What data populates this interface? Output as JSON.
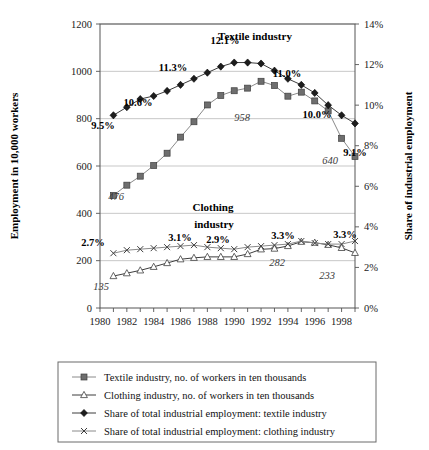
{
  "chart_data": {
    "type": "line",
    "title": "",
    "xlabel": "",
    "ylabel": "Employment in 10,000 workers",
    "y2label": "Share of industrial employment",
    "xlim": [
      1980,
      1999
    ],
    "ylim": [
      0,
      1200
    ],
    "y2lim": [
      0,
      14
    ],
    "grid": true,
    "legend_position": "bottom",
    "x": [
      1981,
      1982,
      1983,
      1984,
      1985,
      1986,
      1987,
      1988,
      1989,
      1990,
      1991,
      1992,
      1993,
      1994,
      1995,
      1996,
      1997,
      1998,
      1999
    ],
    "xtick_labels": [
      "1980",
      "1982",
      "1984",
      "1986",
      "1988",
      "1990",
      "1992",
      "1994",
      "1996",
      "1998"
    ],
    "xticks": [
      1980,
      1982,
      1984,
      1986,
      1988,
      1990,
      1992,
      1994,
      1996,
      1998
    ],
    "ytick_labels": [
      "0",
      "200",
      "400",
      "600",
      "800",
      "1000",
      "1200"
    ],
    "yticks": [
      0,
      200,
      400,
      600,
      800,
      1000,
      1200
    ],
    "y2tick_labels": [
      "0%",
      "2%",
      "4%",
      "6%",
      "8%",
      "10%",
      "12%",
      "14%"
    ],
    "y2ticks": [
      0,
      2,
      4,
      6,
      8,
      10,
      12,
      14
    ],
    "series": [
      {
        "name": "Textile industry, no. of workers in ten thousands",
        "key": "textile_workers",
        "axis": "left",
        "marker": "square",
        "values": [
          476,
          519,
          557,
          602,
          654,
          722,
          787,
          858,
          898,
          918,
          929,
          958,
          940,
          895,
          912,
          875,
          833,
          717,
          640
        ]
      },
      {
        "name": "Clothing industry, no. of workers in ten thousands",
        "key": "clothing_workers",
        "axis": "left",
        "marker": "triangle",
        "values": [
          135,
          147,
          159,
          174,
          190,
          206,
          212,
          216,
          216,
          216,
          228,
          248,
          251,
          262,
          280,
          276,
          267,
          254,
          233
        ]
      },
      {
        "name": "Share of total industrial employment: textile industry",
        "key": "textile_share",
        "axis": "right",
        "marker": "diamond",
        "values": [
          9.5,
          9.9,
          10.3,
          10.45,
          10.7,
          11.0,
          11.3,
          11.6,
          11.9,
          12.1,
          12.1,
          12.05,
          11.7,
          11.3,
          11.0,
          10.6,
          10.0,
          9.5,
          9.1
        ]
      },
      {
        "name": "Share of total industrial employment: clothing industry",
        "key": "clothing_share",
        "axis": "right",
        "marker": "x",
        "values": [
          2.7,
          2.85,
          2.9,
          2.95,
          3.0,
          3.05,
          3.1,
          3.0,
          2.95,
          2.9,
          3.0,
          3.05,
          3.1,
          3.15,
          3.3,
          3.2,
          3.15,
          3.15,
          3.3
        ]
      }
    ],
    "percent_annotations": [
      {
        "text": "9.5%",
        "x": 1981,
        "value": 9.5,
        "px": 103,
        "py": 129
      },
      {
        "text": "10.6%",
        "x": 1985,
        "value": 10.7,
        "px": 138,
        "py": 106
      },
      {
        "text": "11.3%",
        "x": 1987,
        "value": 11.3,
        "px": 173,
        "py": 71
      },
      {
        "text": "12.1%",
        "x": 1990,
        "value": 12.1,
        "px": 225,
        "py": 44
      },
      {
        "text": "11.0%",
        "x": 1995,
        "value": 11.0,
        "px": 287,
        "py": 77
      },
      {
        "text": "10.0%",
        "x": 1997,
        "value": 10.0,
        "px": 317,
        "py": 118
      },
      {
        "text": "9.1%",
        "x": 1999,
        "value": 9.1,
        "px": 355,
        "py": 156
      },
      {
        "text": "2.7%",
        "x": 1981,
        "value": 2.7,
        "px": 93,
        "py": 246
      },
      {
        "text": "3.1%",
        "x": 1987,
        "value": 3.1,
        "px": 180,
        "py": 241
      },
      {
        "text": "2.9%",
        "x": 1990,
        "value": 2.9,
        "px": 218,
        "py": 243
      },
      {
        "text": "3.3%",
        "x": 1995,
        "value": 3.3,
        "px": 283,
        "py": 239
      },
      {
        "text": "3.3%",
        "x": 1999,
        "value": 3.3,
        "px": 345,
        "py": 238
      }
    ],
    "value_annotations": [
      {
        "text": "476",
        "x": 1981,
        "value": 476,
        "px": 116,
        "py": 200
      },
      {
        "text": "958",
        "x": 1992,
        "value": 958,
        "px": 242,
        "py": 121
      },
      {
        "text": "640",
        "x": 1999,
        "value": 640,
        "px": 330,
        "py": 164
      },
      {
        "text": "135",
        "x": 1981,
        "value": 135,
        "px": 101,
        "py": 290
      },
      {
        "text": "282",
        "x": 1995,
        "value": 282,
        "px": 277,
        "py": 266
      },
      {
        "text": "233",
        "x": 1999,
        "value": 233,
        "px": 327,
        "py": 279
      }
    ],
    "series_annotations": [
      {
        "text": "Textile industry",
        "px": 255,
        "py": 40
      },
      {
        "text": "Clothing",
        "px": 213,
        "py": 211
      },
      {
        "text": "industry",
        "px": 214,
        "py": 228
      }
    ]
  },
  "legend": {
    "items": [
      {
        "marker": "square",
        "label": "Textile industry, no. of workers in ten thousands"
      },
      {
        "marker": "triangle",
        "label": "Clothing industry, no. of workers in ten thousands"
      },
      {
        "marker": "diamond",
        "label": "Share of total industrial employment: textile industry"
      },
      {
        "marker": "x",
        "label": "Share of total industrial employment: clothing industry"
      }
    ]
  },
  "axes": {
    "left_title": "Employment in 10,000 workers",
    "right_title": "Share of industrial employment"
  },
  "colors": {
    "frame": "#555555",
    "grid": "#b9b9b9",
    "textile_line": "#8a8a8a",
    "clothing_line": "#6f6f6f",
    "share_line": "#3d3d3d",
    "text": "#111111"
  }
}
